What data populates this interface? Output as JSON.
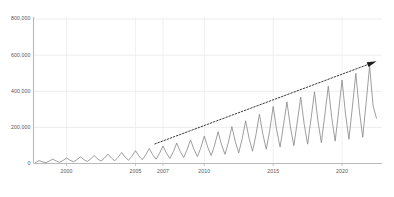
{
  "chart_data": {
    "type": "line",
    "title": "",
    "subtitle": "",
    "xlabel": "",
    "ylabel": "",
    "xlim": [
      1997.6,
      2022.9
    ],
    "ylim": [
      0,
      800000
    ],
    "grid": true,
    "legend": null,
    "legend_position": "none",
    "y_ticks": [
      0,
      200000,
      400000,
      600000,
      800000
    ],
    "y_tick_labels": [
      "0",
      "200,000",
      "400,000",
      "600,000",
      "800,000"
    ],
    "x_ticks": [
      2000,
      2005,
      2007,
      2010,
      2015,
      2020
    ],
    "x_tick_labels": [
      "2000",
      "2005",
      "2007",
      "2010",
      "2015",
      "2020"
    ],
    "series": [
      {
        "name": "seasonal-series",
        "color": "#8c8c8c",
        "x": [
          1997.75,
          1998.0,
          1998.25,
          1998.5,
          1998.75,
          1999.0,
          1999.25,
          1999.5,
          1999.75,
          2000.0,
          2000.25,
          2000.5,
          2000.75,
          2001.0,
          2001.25,
          2001.5,
          2001.75,
          2002.0,
          2002.25,
          2002.5,
          2002.75,
          2003.0,
          2003.25,
          2003.5,
          2003.75,
          2004.0,
          2004.25,
          2004.5,
          2004.75,
          2005.0,
          2005.25,
          2005.5,
          2005.75,
          2006.0,
          2006.25,
          2006.5,
          2006.75,
          2007.0,
          2007.25,
          2007.5,
          2007.75,
          2008.0,
          2008.25,
          2008.5,
          2008.75,
          2009.0,
          2009.25,
          2009.5,
          2009.75,
          2010.0,
          2010.25,
          2010.5,
          2010.75,
          2011.0,
          2011.25,
          2011.5,
          2011.75,
          2012.0,
          2012.25,
          2012.5,
          2012.75,
          2013.0,
          2013.25,
          2013.5,
          2013.75,
          2014.0,
          2014.25,
          2014.5,
          2014.75,
          2015.0,
          2015.25,
          2015.5,
          2015.75,
          2016.0,
          2016.25,
          2016.5,
          2016.75,
          2017.0,
          2017.25,
          2017.5,
          2017.75,
          2018.0,
          2018.25,
          2018.5,
          2018.75,
          2019.0,
          2019.25,
          2019.5,
          2019.75,
          2020.0,
          2020.25,
          2020.5,
          2020.75,
          2021.0,
          2021.25,
          2021.5,
          2021.75,
          2022.0,
          2022.25,
          2022.5
        ],
        "values": [
          6000,
          16000,
          9000,
          5000,
          14000,
          24000,
          14000,
          7000,
          17000,
          30000,
          18000,
          9000,
          21000,
          37000,
          22000,
          11000,
          25000,
          44000,
          26000,
          13000,
          30000,
          52000,
          31000,
          15000,
          35000,
          61000,
          36000,
          18000,
          41000,
          71000,
          42000,
          21000,
          48000,
          83000,
          49000,
          24000,
          56000,
          97000,
          57000,
          28000,
          65000,
          113000,
          67000,
          33000,
          76000,
          131000,
          78000,
          38000,
          88000,
          152000,
          90000,
          44000,
          102000,
          176000,
          104000,
          51000,
          118000,
          204000,
          121000,
          59000,
          137000,
          236000,
          140000,
          68000,
          159000,
          273000,
          162000,
          79000,
          184000,
          316000,
          187000,
          91000,
          213000,
          341000,
          202000,
          99000,
          230000,
          368000,
          218000,
          107000,
          248000,
          397000,
          235000,
          115000,
          268000,
          428000,
          254000,
          124000,
          289000,
          462000,
          274000,
          134000,
          312000,
          499000,
          296000,
          145000,
          337000,
          539000,
          320000,
          250000
        ]
      }
    ],
    "annotations": [
      {
        "name": "trend-arrow",
        "type": "dotted-arrow",
        "color": "#3a3a3a",
        "x_start": 2006.4,
        "y_start": 108000,
        "x_end": 2022.3,
        "y_end": 560000,
        "arrowhead": "triangle-right"
      }
    ]
  }
}
